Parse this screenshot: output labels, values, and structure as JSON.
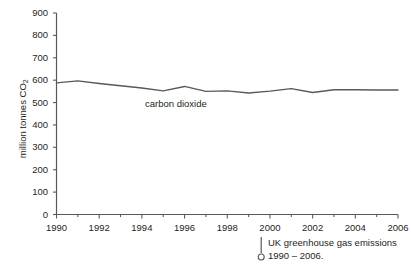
{
  "chart_data": {
    "type": "line",
    "title": "",
    "subtitle": "",
    "xlabel": "",
    "ylabel": "million tonnes CO2",
    "ylabel_prefix": "million tonnes CO",
    "ylabel_sub": "2",
    "xlim": [
      1990,
      2006
    ],
    "ylim": [
      0,
      900
    ],
    "grid": false,
    "legend_position": "inline-annotation",
    "x_tick_labels": [
      "1990",
      "1992",
      "1994",
      "1996",
      "1998",
      "2000",
      "2002",
      "2004",
      "2006"
    ],
    "x_tick_values": [
      1990,
      1992,
      1994,
      1996,
      1998,
      2000,
      2002,
      2004,
      2006
    ],
    "x_minor_tick_values": [
      1991,
      1993,
      1995,
      1997,
      1999,
      2001,
      2003,
      2005
    ],
    "y_tick_labels": [
      "0",
      "100",
      "200",
      "300",
      "400",
      "500",
      "600",
      "700",
      "800",
      "900"
    ],
    "y_tick_values": [
      0,
      100,
      200,
      300,
      400,
      500,
      600,
      700,
      800,
      900
    ],
    "x": [
      1990,
      1991,
      1992,
      1993,
      1994,
      1995,
      1996,
      1997,
      1998,
      1999,
      2000,
      2001,
      2002,
      2003,
      2004,
      2005,
      2006
    ],
    "series": [
      {
        "name": "carbon dioxide",
        "color": "#58595b",
        "values": [
          588,
          597,
          585,
          575,
          565,
          552,
          572,
          550,
          552,
          543,
          551,
          562,
          545,
          557,
          557,
          556,
          556
        ]
      }
    ],
    "annotations": [
      {
        "text": "carbon dioxide",
        "x": 1994.3,
        "y": 515
      }
    ],
    "axis_color": "#58595b",
    "text_color": "#231f20"
  },
  "caption": {
    "line1": "UK greenhouse gas emissions",
    "line2": "1990 – 2006.",
    "marker_icon": "pin-marker-icon"
  }
}
